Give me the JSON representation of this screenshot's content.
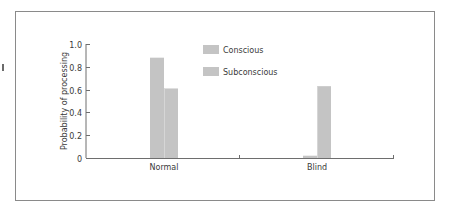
{
  "chart_data": {
    "type": "bar",
    "title": "",
    "xlabel": "",
    "ylabel": "Probability of processing",
    "categories": [
      "Normal",
      "Blind"
    ],
    "series": [
      {
        "name": "Conscious",
        "values": [
          0.88,
          0.02
        ],
        "color": "#c4c4c4"
      },
      {
        "name": "Subconscious",
        "values": [
          0.61,
          0.63
        ],
        "color": "#c4c4c4"
      }
    ],
    "ylim": [
      0,
      1.0
    ],
    "yticks": [
      "0",
      "0.2",
      "0.4",
      "0.6",
      "0.8",
      "1.0"
    ],
    "grid": false,
    "legend_position": "top-center"
  },
  "legend": {
    "items": [
      {
        "label": "Conscious"
      },
      {
        "label": "Subconscious"
      }
    ]
  },
  "colors": {
    "bar": "#c4c4c4",
    "axis": "#6e6e6e",
    "frame": "#8a8a8a",
    "text": "#3a3a3a"
  }
}
